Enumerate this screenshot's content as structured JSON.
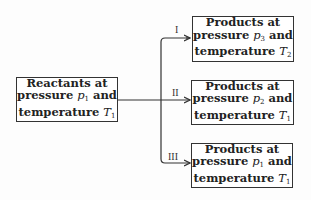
{
  "reactants": {
    "line1": "Reactants at",
    "line2_pre": "pressure ",
    "var_p": "p",
    "p_sub": "1",
    "line2_post": " and",
    "line3_pre": "temperature ",
    "var_T": "T",
    "T_sub": "1"
  },
  "paths": [
    {
      "label": "I"
    },
    {
      "label": "II"
    },
    {
      "label": "III"
    }
  ],
  "products": [
    {
      "line1": "Products at",
      "line2_pre": "pressure ",
      "var_p": "p",
      "p_sub": "3",
      "line2_post": " and",
      "line3_pre": "temperature ",
      "var_T": "T",
      "T_sub": "2"
    },
    {
      "line1": "Products at",
      "line2_pre": "pressure ",
      "var_p": "p",
      "p_sub": "2",
      "line2_post": " and",
      "line3_pre": "temperature ",
      "var_T": "T",
      "T_sub": "1"
    },
    {
      "line1": "Products at",
      "line2_pre": "pressure ",
      "var_p": "p",
      "p_sub": "1",
      "line2_post": " and",
      "line3_pre": "temperature ",
      "var_T": "T",
      "T_sub": "1"
    }
  ]
}
